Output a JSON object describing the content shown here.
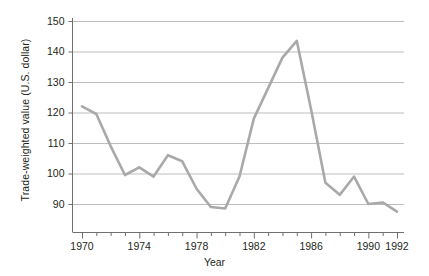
{
  "chart_data": {
    "type": "line",
    "title": "",
    "xlabel": "Year",
    "ylabel": "Trade-weighted value (U.S. dollar)",
    "xlim": [
      1970,
      1992
    ],
    "ylim": [
      85,
      152
    ],
    "grid": true,
    "legend": "none",
    "x_major_ticks": [
      1970,
      1974,
      1978,
      1982,
      1986,
      1990,
      1992
    ],
    "x_major_tick_labels": [
      "1970",
      "1974",
      "1978",
      "1982",
      "1986",
      "1990",
      "1992"
    ],
    "x_minor_ticks": [
      1971,
      1972,
      1973,
      1975,
      1976,
      1977,
      1979,
      1980,
      1981,
      1983,
      1984,
      1985,
      1987,
      1988,
      1989,
      1991
    ],
    "y_ticks": [
      90,
      100,
      110,
      120,
      130,
      140,
      150
    ],
    "y_tick_labels": [
      "90",
      "100",
      "110",
      "120",
      "130",
      "140",
      "150"
    ],
    "series": [
      {
        "name": "Trade-weighted value (U.S. dollar)",
        "color": "#a9a9a9",
        "x": [
          1970,
          1971,
          1972,
          1973,
          1974,
          1975,
          1976,
          1977,
          1978,
          1979,
          1980,
          1981,
          1982,
          1983,
          1984,
          1985,
          1986,
          1987,
          1988,
          1989,
          1990,
          1991,
          1992
        ],
        "values": [
          122,
          119.5,
          109,
          99.5,
          102,
          99,
          106,
          104,
          95,
          89,
          88.5,
          99,
          118,
          128,
          138,
          143.5,
          121,
          97,
          93,
          99,
          90,
          90.5,
          87.5
        ]
      }
    ]
  },
  "colors": {
    "line": "#a9a9a9",
    "grid": "#b5b5b5",
    "axis": "#6f6f6f",
    "text": "#231f20",
    "background": "#ffffff"
  }
}
